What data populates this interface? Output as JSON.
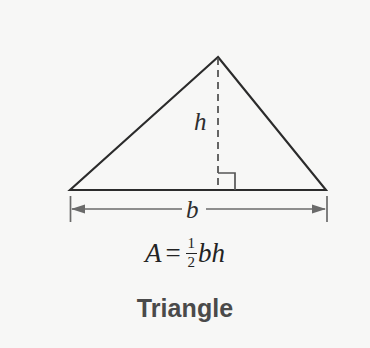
{
  "figure": {
    "title": "Triangle",
    "background_color": "#f7f7f6",
    "stroke_color": "#2b2b2b",
    "dimension_color": "#6a6a6a",
    "label_color": "#2e2e2e",
    "title_color": "#4a4a4a"
  },
  "labels": {
    "height": "h",
    "base": "b"
  },
  "formula": {
    "area_symbol": "A",
    "equals": "=",
    "numerator": "1",
    "denominator": "2",
    "terms": "bh",
    "full_text": "A = 1/2 bh"
  },
  "geometry": {
    "apex": {
      "x": 218,
      "y": 57
    },
    "left_vertex": {
      "x": 70,
      "y": 190
    },
    "right_vertex": {
      "x": 326,
      "y": 190
    },
    "height_line": {
      "x": 218,
      "y_top": 57,
      "y_bottom": 190,
      "style": "dashed"
    },
    "right_angle_marker": {
      "x": 218,
      "y": 172,
      "size": 17
    },
    "base_dimension": {
      "y": 209,
      "x_start": 70,
      "x_end": 327,
      "tick_top": 196,
      "tick_bottom": 222
    }
  }
}
